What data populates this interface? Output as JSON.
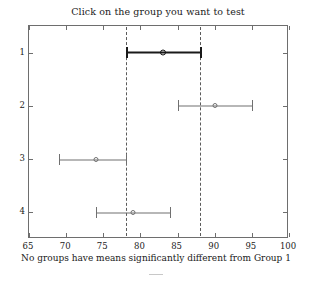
{
  "window": {
    "app": "multcompare-figure"
  },
  "chart_data": {
    "type": "scatter",
    "title": "Click on the group you want to test",
    "xlabel": "No groups have means significantly different from Group 1",
    "ylabel": "",
    "xlim": [
      65,
      100
    ],
    "ylim": [
      0.5,
      4.5
    ],
    "grid": false,
    "legend": null,
    "xticks": [
      65,
      70,
      75,
      80,
      85,
      90,
      95,
      100
    ],
    "xticklabels": [
      "65",
      "70",
      "75",
      "80",
      "85",
      "90",
      "95",
      "100"
    ],
    "yticks": [
      1,
      2,
      3,
      4
    ],
    "yticklabels": [
      "1",
      "2",
      "3",
      "4"
    ],
    "reference_lines": {
      "values": [
        78,
        88
      ],
      "style": "dashed",
      "color": "#5a5a5a",
      "label": "selected group confidence interval bounds"
    },
    "selected_group": 1,
    "selected_color": "#1a1a1a",
    "series_color": "#707070",
    "series": [
      {
        "name": "Group 1",
        "group": 1,
        "y": 1,
        "mean": 83,
        "ci_low": 78,
        "ci_high": 88,
        "selected": true
      },
      {
        "name": "Group 2",
        "group": 2,
        "y": 2,
        "mean": 90,
        "ci_low": 85,
        "ci_high": 95,
        "selected": false
      },
      {
        "name": "Group 3",
        "group": 3,
        "y": 3,
        "mean": 74,
        "ci_low": 69,
        "ci_high": 78,
        "selected": false
      },
      {
        "name": "Group 4",
        "group": 4,
        "y": 4,
        "mean": 79,
        "ci_low": 74,
        "ci_high": 84,
        "selected": false
      }
    ]
  }
}
